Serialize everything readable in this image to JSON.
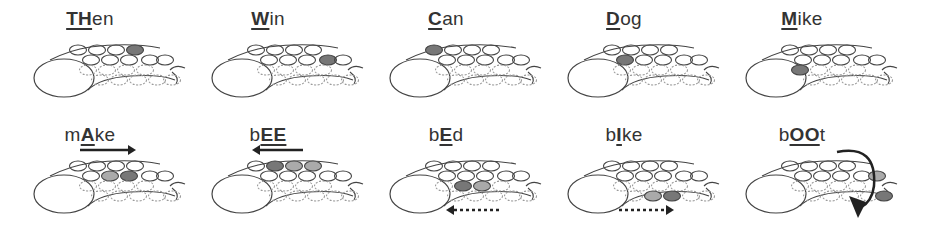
{
  "colors": {
    "outline": "#444444",
    "fill_dark": "#777777",
    "fill_light": "#aaaaaa",
    "text": "#333333",
    "arrow": "#222222"
  },
  "panels": [
    {
      "row": 0,
      "col": 0,
      "word_parts": [
        {
          "t": "TH",
          "hl": true
        },
        {
          "t": "en",
          "hl": false
        }
      ],
      "active": [
        {
          "row": "t",
          "i": 3,
          "shade": "dark"
        }
      ],
      "arrow": null
    },
    {
      "row": 0,
      "col": 1,
      "word_parts": [
        {
          "t": "W",
          "hl": true
        },
        {
          "t": "in",
          "hl": false
        }
      ],
      "active": [
        {
          "row": "s",
          "i": 3,
          "shade": "dark"
        }
      ],
      "arrow": null
    },
    {
      "row": 0,
      "col": 2,
      "word_parts": [
        {
          "t": "C",
          "hl": true
        },
        {
          "t": "an",
          "hl": false
        }
      ],
      "active": [
        {
          "row": "t",
          "i": 0,
          "shade": "dark"
        }
      ],
      "arrow": null
    },
    {
      "row": 0,
      "col": 3,
      "word_parts": [
        {
          "t": "D",
          "hl": true
        },
        {
          "t": "og",
          "hl": false
        }
      ],
      "active": [
        {
          "row": "s",
          "i": 0,
          "shade": "dark"
        }
      ],
      "arrow": null
    },
    {
      "row": 0,
      "col": 4,
      "word_parts": [
        {
          "t": "M",
          "hl": true
        },
        {
          "t": "ike",
          "hl": false
        }
      ],
      "active": [
        {
          "row": "d1",
          "i": 0,
          "shade": "dark"
        }
      ],
      "arrow": null
    },
    {
      "row": 1,
      "col": 0,
      "word_parts": [
        {
          "t": "m",
          "hl": false
        },
        {
          "t": "A",
          "hl": true
        },
        {
          "t": "ke",
          "hl": false
        }
      ],
      "active": [
        {
          "row": "s",
          "i": 1,
          "shade": "light"
        },
        {
          "row": "s",
          "i": 2,
          "shade": "dark"
        }
      ],
      "arrow": "solid-right"
    },
    {
      "row": 1,
      "col": 1,
      "word_parts": [
        {
          "t": "b",
          "hl": false
        },
        {
          "t": "EE",
          "hl": true
        }
      ],
      "active": [
        {
          "row": "t",
          "i": 1,
          "shade": "dark"
        },
        {
          "row": "t",
          "i": 2,
          "shade": "light"
        },
        {
          "row": "t",
          "i": 3,
          "shade": "light"
        }
      ],
      "arrow": "solid-left"
    },
    {
      "row": 1,
      "col": 2,
      "word_parts": [
        {
          "t": "b",
          "hl": false
        },
        {
          "t": "E",
          "hl": true
        },
        {
          "t": "d",
          "hl": false
        }
      ],
      "active": [
        {
          "row": "d1",
          "i": 1,
          "shade": "dark"
        },
        {
          "row": "d1",
          "i": 2,
          "shade": "light"
        }
      ],
      "arrow": "dotted-left"
    },
    {
      "row": 1,
      "col": 3,
      "word_parts": [
        {
          "t": "b",
          "hl": false
        },
        {
          "t": "I",
          "hl": true
        },
        {
          "t": "ke",
          "hl": false
        }
      ],
      "active": [
        {
          "row": "d2",
          "i": 1,
          "shade": "light"
        },
        {
          "row": "d2",
          "i": 2,
          "shade": "dark"
        }
      ],
      "arrow": "dotted-right"
    },
    {
      "row": 1,
      "col": 4,
      "word_parts": [
        {
          "t": "b",
          "hl": false
        },
        {
          "t": "OO",
          "hl": true
        },
        {
          "t": "t",
          "hl": false
        }
      ],
      "active": [
        {
          "row": "s",
          "i": 4,
          "shade": "light"
        },
        {
          "row": "d2",
          "i": 4,
          "shade": "dark"
        }
      ],
      "arrow": "curved-down"
    }
  ]
}
